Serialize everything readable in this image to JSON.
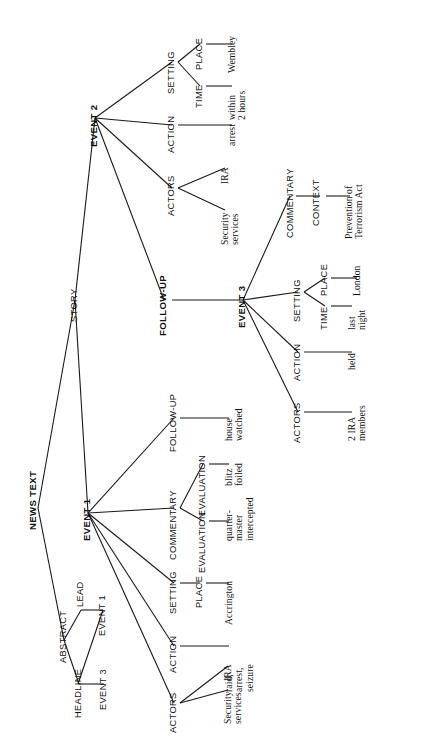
{
  "diagram": {
    "title": "NEWS TEXT",
    "type": "news-text-structure-tree",
    "orientation": "rotated-90-ccw",
    "nodes": {
      "news_text": "NEWS TEXT",
      "abstract": "ABSTRACT",
      "headline": "HEADLINE",
      "lead": "LEAD",
      "story": "STORY",
      "abstract_event1": "EVENT 1",
      "abstract_event3": "EVENT 3",
      "event1": "EVENT 1",
      "event2": "EVENT 2",
      "event3": "EVENT 3",
      "e1_actors": "ACTORS",
      "e1_action": "ACTION",
      "e1_setting": "SETTING",
      "e1_commentary": "COMMENTARY",
      "e1_followup": "FOLLOW-UP",
      "e1_place": "PLACE",
      "e1_eval_a": "EVALUATION",
      "e1_eval_b": "EVALUATION",
      "e1_eval_c": "EVALUATION",
      "e2_followup": "FOLLOW-UP",
      "e2_actors": "ACTORS",
      "e2_action": "ACTION",
      "e2_setting": "SETTING",
      "e2_time": "TIME",
      "e2_place": "PLACE",
      "e3_actors": "ACTORS",
      "e3_action": "ACTION",
      "e3_setting": "SETTING",
      "e3_time": "TIME",
      "e3_place": "PLACE",
      "e3_commentary": "COMMENTARY",
      "e3_context": "CONTEXT"
    },
    "leaves": {
      "e1_actors_v1": "Security\nservices",
      "e1_actors_v2": "IRA",
      "e1_action_v": "raid,\narrest,\nseizure",
      "e1_place_v": "Accrington",
      "e1_eval_v1": "blitz\nfoiled",
      "e1_eval_v2": "quarter-\nmaster\nintercepted",
      "e1_followup_v": "house\nwatched",
      "e2_actors_v1": "Security\nservices",
      "e2_actors_v2": "IRA",
      "e2_action_v": "arrest",
      "e2_time_v": "within\n2 hours",
      "e2_place_v": "Wembley",
      "e3_actors_v": "2 IRA\nmembers",
      "e3_action_v": "held",
      "e3_time_v": "last\nnight",
      "e3_place_v": "London",
      "e3_context_v": "Prevention of\nTerrorism Act"
    },
    "colors": {
      "ink": "#1a1a1a",
      "background": "#ffffff"
    }
  }
}
